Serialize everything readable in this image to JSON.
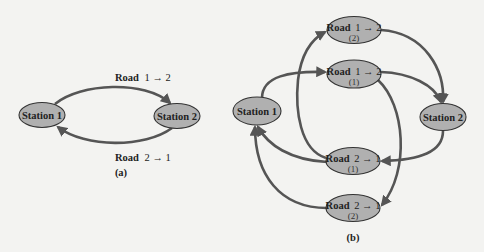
{
  "colors": {
    "background": "#f3f3f1",
    "node_fill": "#b0b0b0",
    "node_stroke": "#333333",
    "edge": "#555555",
    "text": "#222222"
  },
  "panel_a": {
    "label": "(a)",
    "nodes": {
      "station1": "Station 1",
      "station2": "Station 2"
    },
    "edges": {
      "road12": {
        "word": "Road",
        "direction": "1 → 2"
      },
      "road21": {
        "word": "Road",
        "direction": "2 → 1"
      }
    }
  },
  "panel_b": {
    "label": "(b)",
    "nodes": {
      "station1": "Station 1",
      "station2": "Station 2",
      "road12_2": {
        "word": "Road",
        "direction": "1 → 2",
        "index": "(2)"
      },
      "road12_1": {
        "word": "Road",
        "direction": "1 → 2",
        "index": "(1)"
      },
      "road21_1": {
        "word": "Road",
        "direction": "2 → 1",
        "index": "(1)"
      },
      "road21_2": {
        "word": "Road",
        "direction": "2 → 1",
        "index": "(2)"
      }
    }
  }
}
